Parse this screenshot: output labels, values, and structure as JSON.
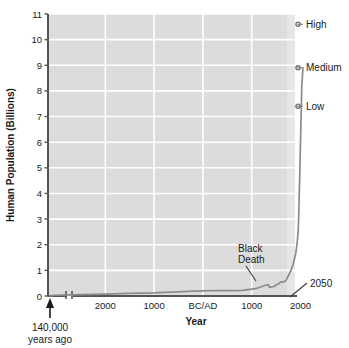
{
  "chart_data": {
    "type": "line",
    "title": "",
    "xlabel": "Year",
    "ylabel": "Human Population (Billions)",
    "ylim": [
      0,
      11
    ],
    "yticks": [
      0,
      1,
      2,
      3,
      4,
      5,
      6,
      7,
      8,
      9,
      10,
      11
    ],
    "ytick_labels": [
      "0",
      "1",
      "2",
      "3",
      "4",
      "5",
      "6",
      "7",
      "8",
      "9",
      "10",
      "11"
    ],
    "xticks": [
      -2000,
      -1000,
      0,
      1000,
      2000
    ],
    "xtick_labels": [
      "2000",
      "1000",
      "BC/AD",
      "1000",
      "2000"
    ],
    "grid": true,
    "legend_position": "none",
    "axis_break": {
      "present": true,
      "label": "140,000 years ago",
      "note_line1": "140,000",
      "note_line2": "years ago"
    },
    "annotations": [
      {
        "label": "Black Death",
        "line1": "Black",
        "line2": "Death",
        "x_year": 1350,
        "y_value": 0.37
      },
      {
        "label": "2050",
        "x_year": 2050,
        "y_value": 0
      }
    ],
    "projections": [
      {
        "name": "High",
        "label": "High",
        "value": 10.6
      },
      {
        "name": "Medium",
        "label": "Medium",
        "value": 8.9
      },
      {
        "name": "Low",
        "label": "Low",
        "value": 7.4
      }
    ],
    "series": [
      {
        "name": "World population",
        "color": "#8c8c8c",
        "x": [
          -140000,
          -10000,
          -8000,
          -6000,
          -5000,
          -4000,
          -3000,
          -2500,
          -2000,
          -1500,
          -1000,
          -800,
          -500,
          -200,
          0,
          200,
          400,
          600,
          800,
          1000,
          1100,
          1200,
          1250,
          1300,
          1340,
          1350,
          1360,
          1400,
          1450,
          1500,
          1550,
          1600,
          1650,
          1700,
          1750,
          1800,
          1850,
          1900,
          1927,
          1950,
          1960,
          1974,
          1987,
          1999,
          2011,
          2025,
          2050
        ],
        "y": [
          0.001,
          0.004,
          0.005,
          0.007,
          0.01,
          0.02,
          0.03,
          0.05,
          0.07,
          0.1,
          0.12,
          0.14,
          0.16,
          0.19,
          0.2,
          0.21,
          0.21,
          0.21,
          0.22,
          0.27,
          0.3,
          0.36,
          0.4,
          0.43,
          0.44,
          0.37,
          0.35,
          0.35,
          0.37,
          0.43,
          0.48,
          0.55,
          0.55,
          0.6,
          0.79,
          0.98,
          1.26,
          1.65,
          2.0,
          2.5,
          3.0,
          4.0,
          5.0,
          6.0,
          7.0,
          8.2,
          8.9
        ]
      }
    ],
    "colors": {
      "plot_background": "#dcdcdc",
      "projection_band": "#e6e6e6",
      "gridline": "#ffffff",
      "axis": "#555555",
      "curve": "#8c8c8c",
      "text": "#1a1a1a"
    }
  }
}
